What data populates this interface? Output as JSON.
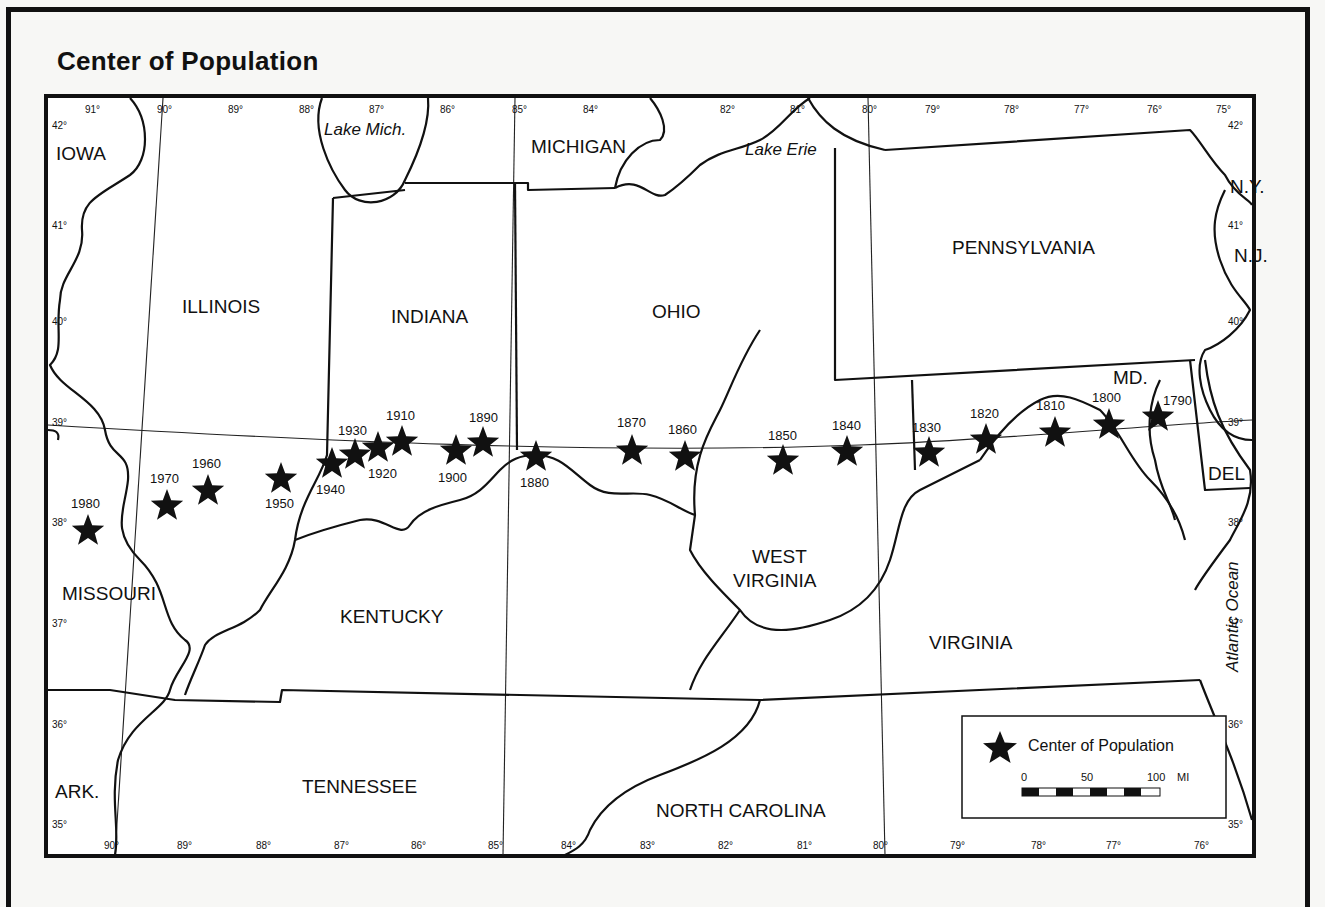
{
  "title": "Center of Population",
  "labels": {
    "states": {
      "iowa": "IOWA",
      "illinois": "ILLINOIS",
      "indiana": "INDIANA",
      "ohio": "OHIO",
      "michigan": "MICHIGAN",
      "pennsylvania": "PENNSYLVANIA",
      "ny": "N.Y.",
      "nj": "N.J.",
      "md": "MD.",
      "del": "DEL",
      "missouri": "MISSOURI",
      "kentucky": "KENTUCKY",
      "west_virginia_1": "WEST",
      "west_virginia_2": "VIRGINIA",
      "virginia": "VIRGINIA",
      "tennessee": "TENNESSEE",
      "north_carolina": "NORTH CAROLINA",
      "ark": "ARK."
    },
    "water": {
      "lake_mich": "Lake Mich.",
      "lake_erie": "Lake Erie",
      "atlantic": "Atlantic Ocean"
    }
  },
  "longitude_ticks_top": [
    "91°",
    "90°",
    "89°",
    "88°",
    "87°",
    "86°",
    "85°",
    "84°",
    "82°",
    "81°",
    "80°",
    "79°",
    "78°",
    "77°",
    "76°",
    "75°"
  ],
  "longitude_ticks_bottom": [
    "90°",
    "89°",
    "88°",
    "87°",
    "86°",
    "85°",
    "84°",
    "83°",
    "82°",
    "81°",
    "80°",
    "79°",
    "78°",
    "77°",
    "76°"
  ],
  "latitude_ticks_left": [
    "42°",
    "41°",
    "40°",
    "39°",
    "38°",
    "37°",
    "36°",
    "35°"
  ],
  "latitude_ticks_right": [
    "42°",
    "41°",
    "40°",
    "39°",
    "38°",
    "37°",
    "36°",
    "35°"
  ],
  "centers": [
    {
      "year": "1790",
      "lon": -76.6,
      "lat": 39.3
    },
    {
      "year": "1800",
      "lon": -76.9,
      "lat": 39.2
    },
    {
      "year": "1810",
      "lon": -77.6,
      "lat": 39.2
    },
    {
      "year": "1820",
      "lon": -78.5,
      "lat": 39.1
    },
    {
      "year": "1830",
      "lon": -79.2,
      "lat": 38.9
    },
    {
      "year": "1840",
      "lon": -80.3,
      "lat": 39.0
    },
    {
      "year": "1850",
      "lon": -81.3,
      "lat": 38.9
    },
    {
      "year": "1860",
      "lon": -82.8,
      "lat": 39.0
    },
    {
      "year": "1870",
      "lon": -83.6,
      "lat": 39.2
    },
    {
      "year": "1880",
      "lon": -84.7,
      "lat": 39.0
    },
    {
      "year": "1890",
      "lon": -85.5,
      "lat": 39.2
    },
    {
      "year": "1900",
      "lon": -85.8,
      "lat": 39.2
    },
    {
      "year": "1910",
      "lon": -86.5,
      "lat": 39.2
    },
    {
      "year": "1920",
      "lon": -86.7,
      "lat": 39.2
    },
    {
      "year": "1930",
      "lon": -87.0,
      "lat": 39.1
    },
    {
      "year": "1940",
      "lon": -87.2,
      "lat": 38.9
    },
    {
      "year": "1950",
      "lon": -88.2,
      "lat": 38.8
    },
    {
      "year": "1960",
      "lon": -89.2,
      "lat": 38.6
    },
    {
      "year": "1970",
      "lon": -89.7,
      "lat": 38.5
    },
    {
      "year": "1980",
      "lon": -90.6,
      "lat": 38.1
    }
  ],
  "legend": {
    "label": "Center of Population",
    "scale": {
      "zero": "0",
      "mid": "50",
      "max": "100",
      "unit": "MI"
    }
  }
}
